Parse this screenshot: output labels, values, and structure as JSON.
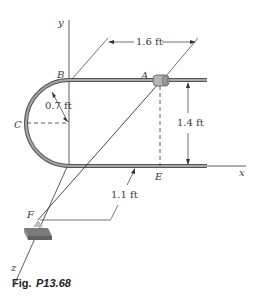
{
  "figure": {
    "caption_prefix": "Fig.",
    "caption_id": "P13.68",
    "points": {
      "A": "A",
      "B": "B",
      "C": "C",
      "E": "E",
      "F": "F"
    },
    "axes": {
      "x": "x",
      "y": "y",
      "z": "z"
    },
    "dimensions": {
      "horizontal_length": "1.6 ft",
      "rail_separation": "1.4 ft",
      "radius": "0.7 ft",
      "support_offset": "1.1 ft"
    },
    "colors": {
      "rod": "#8a8a8a",
      "rod_outline": "#555555",
      "line": "#333333",
      "collar": "#b0b0b0",
      "block": "#9a9a9a"
    }
  }
}
